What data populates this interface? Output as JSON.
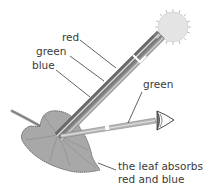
{
  "diagram": {
    "labels": {
      "red": "red",
      "green": "green",
      "blue": "blue",
      "reflected_green": "green",
      "absorb_line1": "the leaf absorbs",
      "absorb_line2": "red and blue"
    },
    "components": {
      "light_source": "sun",
      "incoming_beam": [
        "red",
        "green",
        "blue"
      ],
      "reflected_beam": [
        "green"
      ],
      "observer": "eye",
      "object": "leaf"
    },
    "colors": {
      "beam_dark": "#707070",
      "beam_light": "#bdbdbd",
      "sun_fill": "#e4e4e4",
      "leaf_fill": "#a8a8a8",
      "text": "#3a3a3a"
    }
  }
}
